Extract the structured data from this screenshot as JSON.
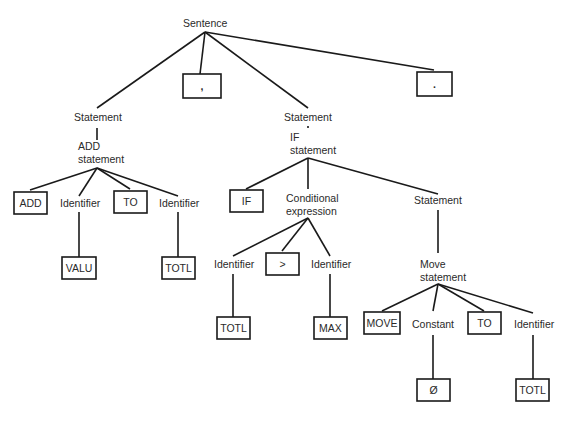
{
  "diagram": {
    "type": "parse-tree",
    "colors": {
      "line": "#1a1a1a",
      "text": "#2a2a2a",
      "background": "#ffffff"
    },
    "nodes": [
      {
        "id": "sentence",
        "kind": "nonterminal",
        "lines": [
          "Sentence"
        ],
        "x": 183,
        "y": 27,
        "anchor_top": [
          205,
          20
        ],
        "anchor_bottom": [
          205,
          32
        ]
      },
      {
        "id": "stmt1",
        "kind": "nonterminal",
        "lines": [
          "Statement"
        ],
        "x": 74,
        "y": 121,
        "anchor_top": [
          97,
          108
        ],
        "anchor_bottom": [
          97,
          128
        ]
      },
      {
        "id": "comma",
        "kind": "terminal",
        "text": ",",
        "box": [
          183,
          74,
          38,
          24
        ],
        "anchor_top": [
          200,
          74
        ]
      },
      {
        "id": "stmt2",
        "kind": "nonterminal",
        "lines": [
          "Statement"
        ],
        "x": 284,
        "y": 121,
        "anchor_top": [
          308,
          108
        ],
        "anchor_bottom": [
          308,
          128
        ]
      },
      {
        "id": "period",
        "kind": "terminal",
        "text": ".",
        "box": [
          417,
          72,
          35,
          24
        ],
        "anchor_top": [
          434,
          70
        ]
      },
      {
        "id": "addstmt",
        "kind": "nonterminal",
        "lines": [
          "ADD",
          "statement"
        ],
        "x": 78,
        "y": 150,
        "anchor_top": [
          97,
          140
        ],
        "anchor_bottom": [
          97,
          168
        ]
      },
      {
        "id": "add_kw",
        "kind": "terminal",
        "text": "ADD",
        "box": [
          14,
          192,
          33,
          22
        ],
        "anchor_top": [
          30,
          190
        ]
      },
      {
        "id": "id1",
        "kind": "nonterminal",
        "lines": [
          "Identifier"
        ],
        "x": 60,
        "y": 207,
        "anchor_top": [
          79,
          196
        ],
        "anchor_bottom": [
          79,
          212
        ]
      },
      {
        "id": "to1",
        "kind": "terminal",
        "text": "TO",
        "box": [
          114,
          191,
          33,
          22
        ],
        "anchor_top": [
          130,
          189
        ]
      },
      {
        "id": "id2",
        "kind": "nonterminal",
        "lines": [
          "Identifier"
        ],
        "x": 159,
        "y": 207,
        "anchor_top": [
          178,
          196
        ],
        "anchor_bottom": [
          178,
          212
        ]
      },
      {
        "id": "valu",
        "kind": "terminal",
        "text": "VALU",
        "box": [
          62,
          257,
          34,
          22
        ],
        "anchor_top": [
          79,
          257
        ]
      },
      {
        "id": "totl1",
        "kind": "terminal",
        "text": "TOTL",
        "box": [
          162,
          257,
          33,
          22
        ],
        "anchor_top": [
          178,
          257
        ]
      },
      {
        "id": "ifstmt",
        "kind": "nonterminal",
        "lines": [
          "IF",
          "statement"
        ],
        "x": 290,
        "y": 141,
        "anchor_top": [
          308,
          126
        ],
        "anchor_bottom": [
          308,
          158
        ]
      },
      {
        "id": "if_kw",
        "kind": "terminal",
        "text": "IF",
        "box": [
          230,
          190,
          33,
          22
        ],
        "anchor_top": [
          246,
          189
        ]
      },
      {
        "id": "condexpr",
        "kind": "nonterminal",
        "lines": [
          "Conditional",
          "expression"
        ],
        "x": 286,
        "y": 202,
        "anchor_top": [
          308,
          189
        ],
        "anchor_bottom": [
          308,
          218
        ]
      },
      {
        "id": "stmt3",
        "kind": "nonterminal",
        "lines": [
          "Statement"
        ],
        "x": 414,
        "y": 204,
        "anchor_top": [
          438,
          194
        ],
        "anchor_bottom": [
          438,
          210
        ]
      },
      {
        "id": "id3",
        "kind": "nonterminal",
        "lines": [
          "Identifier"
        ],
        "x": 214,
        "y": 268,
        "anchor_top": [
          233,
          256
        ],
        "anchor_bottom": [
          233,
          274
        ]
      },
      {
        "id": "gt",
        "kind": "terminal",
        "text": ">",
        "box": [
          266,
          253,
          33,
          22
        ],
        "anchor_top": [
          282,
          251
        ]
      },
      {
        "id": "id4",
        "kind": "nonterminal",
        "lines": [
          "Identifier"
        ],
        "x": 311,
        "y": 268,
        "anchor_top": [
          330,
          256
        ],
        "anchor_bottom": [
          330,
          274
        ]
      },
      {
        "id": "totl2",
        "kind": "terminal",
        "text": "TOTL",
        "box": [
          217,
          317,
          33,
          22
        ],
        "anchor_top": [
          233,
          317
        ]
      },
      {
        "id": "max",
        "kind": "terminal",
        "text": "MAX",
        "box": [
          314,
          317,
          33,
          22
        ],
        "anchor_top": [
          330,
          317
        ]
      },
      {
        "id": "movestmt",
        "kind": "nonterminal",
        "lines": [
          "Move",
          "statement"
        ],
        "x": 420,
        "y": 268,
        "anchor_top": [
          438,
          253
        ],
        "anchor_bottom": [
          438,
          284
        ]
      },
      {
        "id": "move_kw",
        "kind": "terminal",
        "text": "MOVE",
        "box": [
          364,
          312,
          36,
          22
        ],
        "anchor_top": [
          382,
          311
        ]
      },
      {
        "id": "constant",
        "kind": "nonterminal",
        "lines": [
          "Constant"
        ],
        "x": 412,
        "y": 328,
        "anchor_top": [
          433,
          311
        ],
        "anchor_bottom": [
          433,
          335
        ]
      },
      {
        "id": "to2",
        "kind": "terminal",
        "text": "TO",
        "box": [
          468,
          312,
          33,
          22
        ],
        "anchor_top": [
          484,
          311
        ]
      },
      {
        "id": "id5",
        "kind": "nonterminal",
        "lines": [
          "Identifier"
        ],
        "x": 514,
        "y": 328,
        "anchor_top": [
          533,
          313
        ],
        "anchor_bottom": [
          533,
          335
        ]
      },
      {
        "id": "zero",
        "kind": "terminal",
        "text": "Ø",
        "box": [
          417,
          379,
          33,
          22
        ],
        "anchor_top": [
          433,
          379
        ]
      },
      {
        "id": "totl3",
        "kind": "terminal",
        "text": "TOTL",
        "box": [
          516,
          379,
          33,
          22
        ],
        "anchor_top": [
          533,
          379
        ]
      }
    ],
    "edges": [
      [
        "sentence",
        "stmt1"
      ],
      [
        "sentence",
        "comma"
      ],
      [
        "sentence",
        "stmt2"
      ],
      [
        "sentence",
        "period"
      ],
      [
        "stmt1",
        "addstmt"
      ],
      [
        "addstmt",
        "add_kw"
      ],
      [
        "addstmt",
        "id1"
      ],
      [
        "addstmt",
        "to1"
      ],
      [
        "addstmt",
        "id2"
      ],
      [
        "id1",
        "valu"
      ],
      [
        "id2",
        "totl1"
      ],
      [
        "stmt2",
        "ifstmt"
      ],
      [
        "ifstmt",
        "if_kw"
      ],
      [
        "ifstmt",
        "condexpr"
      ],
      [
        "ifstmt",
        "stmt3"
      ],
      [
        "condexpr",
        "id3"
      ],
      [
        "condexpr",
        "gt"
      ],
      [
        "condexpr",
        "id4"
      ],
      [
        "id3",
        "totl2"
      ],
      [
        "id4",
        "max"
      ],
      [
        "stmt3",
        "movestmt"
      ],
      [
        "movestmt",
        "move_kw"
      ],
      [
        "movestmt",
        "constant"
      ],
      [
        "movestmt",
        "to2"
      ],
      [
        "movestmt",
        "id5"
      ],
      [
        "constant",
        "zero"
      ],
      [
        "id5",
        "totl3"
      ]
    ]
  }
}
